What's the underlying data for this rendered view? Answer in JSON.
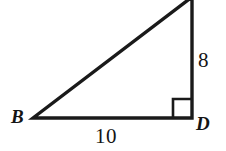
{
  "figure": {
    "kind": "right-triangle-geometry-diagram",
    "background_color": "#ffffff",
    "stroke_color": "#1a1a1a",
    "text_color": "#151515",
    "canvas": {
      "width": 226,
      "height": 151
    }
  },
  "vertices": {
    "b": {
      "label": "B",
      "x": 33,
      "y": 118
    },
    "d": {
      "label": "D",
      "x": 192,
      "y": 118
    },
    "apex": {
      "label": "",
      "x": 192,
      "y": 0
    }
  },
  "sides": {
    "base": {
      "label": "10",
      "from": "B",
      "to": "D"
    },
    "vertical": {
      "label": "8",
      "from": "D",
      "to": "apex"
    },
    "hypotenuse": {
      "label": "",
      "from": "B",
      "to": "apex"
    }
  },
  "markers": {
    "right_angle": {
      "at_vertex": "D",
      "size": 19
    }
  },
  "geometry_path": {
    "triangle": "M 33 118 L 192 118 L 192 -3 Z",
    "right_angle_marker": "M 173 118 L 173 99 L 192 99"
  }
}
